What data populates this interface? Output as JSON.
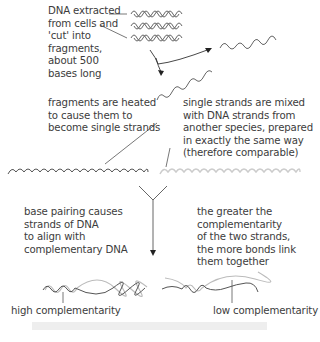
{
  "diagram": {
    "labels": {
      "dna_extracted": "DNA extracted\nfrom cells and\n'cut' into\nfragments,\nabout 500\nbases long",
      "heated": "fragments are heated\nto cause them to\nbecome single strands",
      "mixed": "single strands are mixed\nwith DNA strands from\nanother species, prepared\nin exactly the same way\n(therefore comparable)",
      "base_pairing": "base pairing causes\nstrands of DNA\nto align with\ncomplementary DNA",
      "greater_complementarity": "the greater the\ncomplementarity\nof the two strands,\nthe more bonds link\nthem together",
      "high_complementarity": "high complementarity",
      "low_complementarity": "low complementarity"
    },
    "colors": {
      "species_a_strand": "#555555",
      "species_b_strand": "#c8c8c8",
      "arrow": "#333333",
      "text": "#3c3c3c",
      "footer_bar": "#eeeeee"
    },
    "nodes": [
      {
        "id": "double-helix-fragments",
        "count": 3
      },
      {
        "id": "single-strand-1"
      },
      {
        "id": "single-strand-2"
      },
      {
        "id": "species-a-strand"
      },
      {
        "id": "species-b-strand"
      },
      {
        "id": "hybrid-high"
      },
      {
        "id": "hybrid-low"
      }
    ],
    "edges": [
      {
        "from": "double-helix-fragments",
        "to": "single-strand-1"
      },
      {
        "from": "double-helix-fragments",
        "to": "single-strand-2"
      },
      {
        "from": "species-a-strand",
        "to": "hybrid",
        "via": "merge"
      },
      {
        "from": "species-b-strand",
        "to": "hybrid",
        "via": "merge"
      }
    ]
  }
}
